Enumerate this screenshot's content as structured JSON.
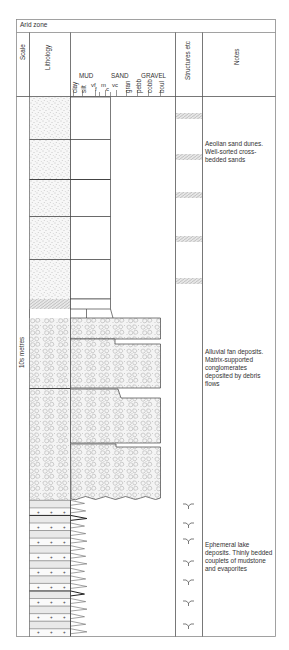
{
  "log": {
    "title": "Arid zone",
    "headers": {
      "scale": "Scale",
      "lithology": "Lithology",
      "grain_groups": [
        "MUD",
        "SAND",
        "GRAVEL"
      ],
      "grain_sizes": [
        "clay",
        "silt",
        "vf",
        "f",
        "m",
        "c",
        "vc",
        "gran",
        "pebb",
        "cobb",
        "boul"
      ],
      "structures": "Structures etc",
      "notes": "Notes"
    },
    "scale_label": "10s metres",
    "colors": {
      "line": "#333333",
      "border": "#8a8a8a",
      "fill": "#f2f2f2",
      "dot": "#9a9a9a"
    },
    "units": [
      {
        "name": "aeolian",
        "note": "Aeolian sand dunes. Well-sorted cross-bedded sands",
        "structure_icon": "cross-bedding-icon",
        "structure_count": 5
      },
      {
        "name": "alluvial-fan",
        "note": "Alluvial fan deposits. Matrix-supported conglomerates deposited by debris flows",
        "structure_icon": "none",
        "structure_count": 0
      },
      {
        "name": "ephemeral-lake",
        "note": "Ephemeral lake deposits. Thinly bedded couplets of mudstone and evaporites",
        "structure_icon": "mudcrack-icon",
        "structure_count": 7
      }
    ]
  }
}
